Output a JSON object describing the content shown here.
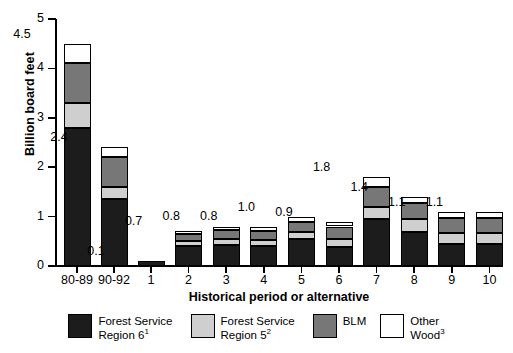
{
  "chart_data": {
    "type": "bar",
    "subtype": "stacked-bar",
    "title": "",
    "xlabel": "Historical period or alternative",
    "ylabel": "Billion board feet",
    "ylim": [
      0,
      5
    ],
    "yticks": [
      0,
      1,
      2,
      3,
      4,
      5
    ],
    "ytick_labels": [
      "0",
      "1",
      "2",
      "3",
      "4",
      "5"
    ],
    "grid": false,
    "legend_position": "bottom",
    "categories": [
      "80-89",
      "90-92",
      "1",
      "2",
      "3",
      "4",
      "5",
      "6",
      "7",
      "8",
      "9",
      "10"
    ],
    "series": [
      {
        "name": "Forest Service Region 6",
        "footnote": "1",
        "color": "#1c1c1c",
        "values": [
          2.8,
          1.35,
          0.1,
          0.4,
          0.42,
          0.4,
          0.55,
          0.38,
          0.95,
          0.68,
          0.45,
          0.45
        ]
      },
      {
        "name": "Forest Service Region 5",
        "footnote": "2",
        "color": "#cfcfcf",
        "values": [
          0.5,
          0.25,
          0.0,
          0.1,
          0.13,
          0.13,
          0.13,
          0.17,
          0.25,
          0.27,
          0.22,
          0.22
        ]
      },
      {
        "name": "BLM",
        "footnote": "",
        "color": "#777777",
        "values": [
          0.8,
          0.6,
          0.0,
          0.15,
          0.18,
          0.18,
          0.22,
          0.25,
          0.4,
          0.33,
          0.3,
          0.3
        ]
      },
      {
        "name": "Other Wood",
        "footnote": "3",
        "color": "#ffffff",
        "values": [
          0.4,
          0.2,
          0.0,
          0.05,
          0.07,
          0.09,
          0.1,
          0.1,
          0.2,
          0.12,
          0.13,
          0.13
        ]
      }
    ],
    "totals": [
      4.5,
      2.4,
      0.1,
      0.7,
      0.8,
      0.8,
      1.0,
      0.9,
      1.8,
      1.4,
      1.1,
      1.1
    ],
    "total_labels": [
      "4.5",
      "2.4",
      "0.1",
      "0.7",
      "0.8",
      "0.8",
      "1.0",
      "0.9",
      "1.8",
      "1.4",
      "1.1",
      "1.1"
    ]
  },
  "legend": {
    "items": [
      {
        "label_line1": "Forest Service",
        "label_line2": "Region 6",
        "sup": "1",
        "swatch": "r6"
      },
      {
        "label_line1": "Forest Service",
        "label_line2": "Region 5",
        "sup": "2",
        "swatch": "r5"
      },
      {
        "label_line1": "BLM",
        "label_line2": "",
        "sup": "",
        "swatch": "blm"
      },
      {
        "label_line1": "Other",
        "label_line2": "Wood",
        "sup": "3",
        "swatch": "other"
      }
    ]
  }
}
